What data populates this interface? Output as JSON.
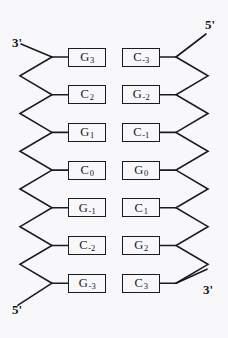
{
  "figure": {
    "kind": "dna-duplex-schematic",
    "width": 228,
    "height": 338,
    "background_color": "#f8f8fa",
    "stroke_color": "#1a1a22",
    "text_color": "#15151c"
  },
  "termini": {
    "top_left": "3'",
    "top_right": "5'",
    "bottom_left": "5'",
    "bottom_right": "3'"
  },
  "strands": {
    "left": {
      "top_terminus": "3'",
      "bottom_terminus": "5'"
    },
    "right": {
      "top_terminus": "5'",
      "bottom_terminus": "3'"
    }
  },
  "base_pairs": [
    {
      "left_base": "G",
      "left_index": "3",
      "right_base": "C",
      "right_index": "-3"
    },
    {
      "left_base": "C",
      "left_index": "2",
      "right_base": "G",
      "right_index": "-2"
    },
    {
      "left_base": "G",
      "left_index": "1",
      "right_base": "C",
      "right_index": "-1"
    },
    {
      "left_base": "C",
      "left_index": "0",
      "right_base": "G",
      "right_index": "0"
    },
    {
      "left_base": "G",
      "left_index": "-1",
      "right_base": "C",
      "right_index": "1"
    },
    {
      "left_base": "C",
      "left_index": "-2",
      "right_base": "G",
      "right_index": "2"
    },
    {
      "left_base": "G",
      "left_index": "-3",
      "right_base": "C",
      "right_index": "3"
    }
  ]
}
